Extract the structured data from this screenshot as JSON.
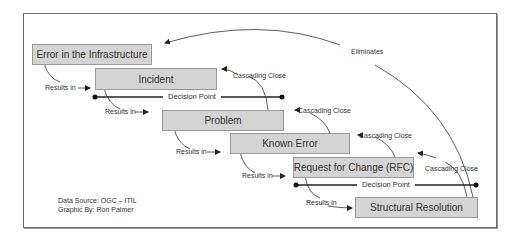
{
  "diagram": {
    "boxes": [
      {
        "id": "error-in-infrastructure",
        "label": "Error in the Infrastructure"
      },
      {
        "id": "incident",
        "label": "Incident"
      },
      {
        "id": "problem",
        "label": "Problem"
      },
      {
        "id": "known-error",
        "label": "Known Error"
      },
      {
        "id": "rfc",
        "label": "Request for Change (RFC)"
      },
      {
        "id": "structural-resolution",
        "label": "Structural Resolution"
      }
    ],
    "results_in_labels": [
      "Results in",
      "Results in",
      "Results in",
      "Results in",
      "Results in"
    ],
    "cascading_close_labels": [
      "Cascading Close",
      "Cascading Close",
      "Cascading Close",
      "Cascading Close"
    ],
    "decision_points": [
      "Decision Point",
      "Decision Point"
    ],
    "eliminates_label": "Eliminates",
    "credits": {
      "source": "Data Source: OGC – ITIL",
      "author": "Graphic By: Ron Palmer"
    },
    "colors": {
      "box_fill": "#d4d4d4",
      "box_border": "#9a9a9a",
      "line": "#333333",
      "frame": "#6a6a6a"
    }
  }
}
